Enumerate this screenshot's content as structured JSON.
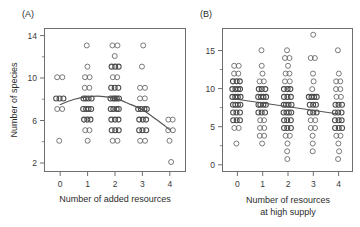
{
  "figure": {
    "width": 360,
    "height": 227,
    "background": "#ffffff",
    "point_color": "#6a6a6a",
    "trend_color": "#555555",
    "axis_color": "#6e6e6e"
  },
  "panels": [
    {
      "key": "A",
      "label": "(A)",
      "chart_index": 0
    },
    {
      "key": "B",
      "label": "(B)",
      "chart_index": 1
    }
  ],
  "chart_data": [
    {
      "type": "scatter",
      "panel": "(A)",
      "title": "",
      "xlabel": "Number of added resources",
      "ylabel": "Number of species",
      "xlim": [
        -0.55,
        4.55
      ],
      "ylim": [
        1.1,
        14.6
      ],
      "xticks": [
        0,
        1,
        2,
        3,
        4
      ],
      "xticklabels": [
        "0",
        "1",
        "2",
        "3",
        "4"
      ],
      "yticks": [
        2,
        6,
        10,
        14
      ],
      "yticklabels": [
        "2",
        "6",
        "10",
        "14"
      ],
      "yticks_minor": [
        4,
        8,
        12
      ],
      "grid": false,
      "legend": null,
      "marker": "open-circle",
      "jitter": "horizontal",
      "series": [
        {
          "name": "plots",
          "x": [
            0,
            0,
            0,
            0,
            0,
            0,
            0,
            0,
            1,
            1,
            1,
            1,
            1,
            1,
            1,
            1,
            1,
            1,
            1,
            1,
            1,
            1,
            1,
            1,
            1,
            1,
            1,
            1,
            2,
            2,
            2,
            2,
            2,
            2,
            2,
            2,
            2,
            2,
            2,
            2,
            2,
            2,
            2,
            2,
            2,
            2,
            2,
            2,
            2,
            2,
            2,
            2,
            2,
            2,
            2,
            2,
            3,
            3,
            3,
            3,
            3,
            3,
            3,
            3,
            3,
            3,
            3,
            3,
            3,
            3,
            3,
            3,
            3,
            3,
            4,
            4,
            4,
            4,
            4,
            4
          ],
          "y": [
            10,
            10,
            8,
            8,
            7,
            7,
            4,
            8,
            13,
            11,
            10,
            10,
            9,
            9,
            8,
            8,
            8,
            8,
            7,
            7,
            7,
            7,
            6,
            6,
            6,
            5,
            5,
            4,
            13,
            13,
            12,
            11,
            11,
            11,
            10,
            10,
            9,
            9,
            9,
            8,
            8,
            8,
            8,
            8,
            7,
            7,
            7,
            7,
            6,
            6,
            6,
            5,
            5,
            5,
            4,
            4,
            13,
            11,
            9,
            9,
            8,
            8,
            7,
            7,
            7,
            7,
            6,
            6,
            6,
            5,
            5,
            4,
            4,
            5,
            6,
            6,
            5,
            5,
            4,
            2
          ]
        }
      ],
      "trend": {
        "kind": "loess-hump",
        "description": "Humped fit peaking near x=1.3 at ~8.1 species, declining to ~5 at x=4",
        "points": [
          [
            0.0,
            7.4
          ],
          [
            0.5,
            7.9
          ],
          [
            1.0,
            8.15
          ],
          [
            1.5,
            8.2
          ],
          [
            2.0,
            8.0
          ],
          [
            2.5,
            7.5
          ],
          [
            3.0,
            6.9
          ],
          [
            3.5,
            6.0
          ],
          [
            4.0,
            5.0
          ]
        ]
      }
    },
    {
      "type": "scatter",
      "panel": "(B)",
      "title": "",
      "xlabel": "Number of resources\nat high supply",
      "xlabel_line1": "Number of resources",
      "xlabel_line2": "at high supply",
      "ylabel": "",
      "xlim": [
        -0.55,
        4.55
      ],
      "ylim": [
        -0.6,
        17.8
      ],
      "xticks": [
        0,
        1,
        2,
        3,
        4
      ],
      "xticklabels": [
        "0",
        "1",
        "2",
        "3",
        "4"
      ],
      "yticks": [
        0,
        5,
        10,
        15
      ],
      "yticklabels": [
        "0",
        "5",
        "10",
        "15"
      ],
      "yticks_minor": [
        2.5,
        7.5,
        12.5
      ],
      "grid": false,
      "legend": null,
      "marker": "open-circle",
      "jitter": "horizontal",
      "series": [
        {
          "name": "plots",
          "x": [
            0,
            0,
            0,
            0,
            0,
            0,
            0,
            0,
            0,
            0,
            0,
            0,
            0,
            0,
            0,
            0,
            0,
            0,
            0,
            0,
            0,
            0,
            0,
            0,
            0,
            0,
            0,
            0,
            1,
            1,
            1,
            1,
            1,
            1,
            1,
            1,
            1,
            1,
            1,
            1,
            1,
            1,
            1,
            1,
            1,
            1,
            1,
            1,
            1,
            1,
            1,
            1,
            1,
            1,
            2,
            2,
            2,
            2,
            2,
            2,
            2,
            2,
            2,
            2,
            2,
            2,
            2,
            2,
            2,
            2,
            2,
            2,
            2,
            2,
            2,
            2,
            2,
            2,
            2,
            2,
            2,
            2,
            2,
            2,
            2,
            2,
            2,
            3,
            3,
            3,
            3,
            3,
            3,
            3,
            3,
            3,
            3,
            3,
            3,
            3,
            3,
            3,
            3,
            3,
            3,
            3,
            3,
            3,
            3,
            3,
            4,
            4,
            4,
            4,
            4,
            4,
            4,
            4,
            4,
            4,
            4,
            4,
            4,
            4,
            4,
            4,
            4,
            4,
            4,
            4,
            4,
            4,
            4,
            4,
            4
          ],
          "y": [
            13,
            13,
            12,
            12,
            11,
            11,
            11,
            10,
            10,
            10,
            10,
            9,
            9,
            9,
            9,
            8,
            8,
            8,
            8,
            7,
            7,
            7,
            6,
            6,
            6,
            5,
            5,
            3,
            15,
            13,
            12,
            11,
            11,
            10,
            10,
            10,
            9,
            9,
            9,
            8,
            8,
            8,
            8,
            7,
            7,
            7,
            6,
            6,
            5,
            5,
            4,
            4,
            3,
            9,
            15,
            14,
            14,
            13,
            12,
            12,
            11,
            11,
            10,
            10,
            10,
            9,
            9,
            9,
            8,
            8,
            8,
            8,
            7,
            7,
            7,
            7,
            6,
            6,
            6,
            5,
            5,
            5,
            4,
            4,
            3,
            2,
            1,
            17,
            14,
            14,
            12,
            11,
            10,
            9,
            9,
            9,
            9,
            8,
            8,
            8,
            7,
            7,
            7,
            6,
            6,
            5,
            5,
            4,
            3,
            2,
            15,
            12,
            11,
            11,
            10,
            10,
            9,
            9,
            8,
            8,
            8,
            7,
            7,
            7,
            6,
            6,
            6,
            5,
            5,
            5,
            4,
            4,
            3,
            2,
            1
          ]
        }
      ],
      "trend": {
        "kind": "linear",
        "description": "Straight declining regression line",
        "points": [
          [
            0.0,
            8.7
          ],
          [
            4.0,
            6.8
          ]
        ]
      }
    }
  ]
}
